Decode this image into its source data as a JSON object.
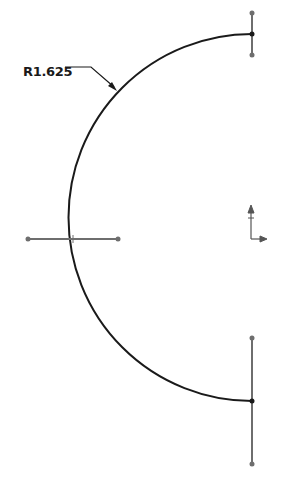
{
  "drawing": {
    "dimension": {
      "label": "R1.625",
      "type": "radius"
    },
    "arc": {
      "center_x": 252,
      "center_y": 217.5,
      "radius": 184,
      "color": "#1a1a1a"
    },
    "construction_lines_color": "#707070",
    "origin_indicator": "origin-axes-icon"
  }
}
